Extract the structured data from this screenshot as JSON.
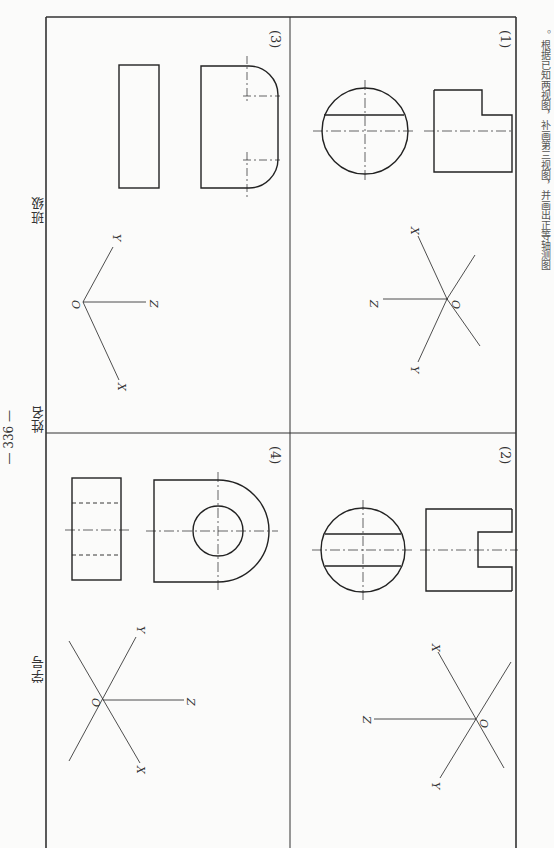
{
  "page": {
    "instruction_text": "。根据已知两视图，补画第三视图，并画出正等轴测图",
    "page_number": "— 336 —",
    "footer_fields": {
      "class_label": "班级",
      "name_label": "姓名",
      "student_id_label": "学号"
    }
  },
  "panels": [
    {
      "id": "1",
      "label": "(1)",
      "axes": {
        "origin": "O",
        "x": "X",
        "y": "Y",
        "z": "Z"
      },
      "views": [
        "circle-with-chord",
        "stepped-rectangle"
      ]
    },
    {
      "id": "2",
      "label": "(2)",
      "axes": {
        "origin": "O",
        "x": "X",
        "y": "Y",
        "z": "Z"
      },
      "views": [
        "circle-with-two-chords",
        "rectangle-with-slot"
      ]
    },
    {
      "id": "3",
      "label": "(3)",
      "axes": {
        "origin": "O",
        "x": "X",
        "y": "Y",
        "z": "Z"
      },
      "views": [
        "rectangle",
        "rounded-end-rectangle"
      ]
    },
    {
      "id": "4",
      "label": "(4)",
      "axes": {
        "origin": "O",
        "x": "X",
        "y": "Y",
        "z": "Z"
      },
      "views": [
        "rectangle-with-hidden-lines",
        "u-shape-with-hole"
      ]
    }
  ]
}
